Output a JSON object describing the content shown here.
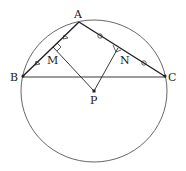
{
  "figure": {
    "type": "geometry",
    "points": {
      "A": {
        "label": "A",
        "x": 79,
        "y": 22
      },
      "B": {
        "label": "B",
        "x": 22,
        "y": 77
      },
      "C": {
        "label": "C",
        "x": 166,
        "y": 77
      },
      "M": {
        "label": "M",
        "x": 53,
        "y": 47
      },
      "N": {
        "label": "N",
        "x": 118,
        "y": 48
      },
      "P": {
        "label": "P",
        "x": 94,
        "y": 91
      }
    },
    "circle": {
      "cx": 94,
      "cy": 91,
      "rx": 73,
      "ry": 71
    },
    "marks": {
      "AB_equal_parts": "triangle",
      "AC_equal_parts": "circle",
      "right_angles": [
        "M",
        "N"
      ]
    },
    "colors": {
      "line": "#222222",
      "circle": "#555555"
    }
  }
}
